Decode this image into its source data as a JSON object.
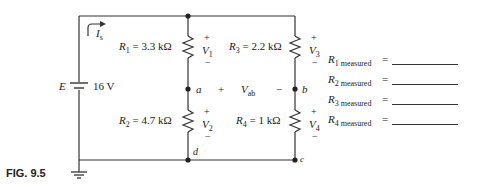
{
  "figure": {
    "label": "FIG. 9.5"
  },
  "circuit": {
    "source": {
      "name": "E",
      "value": "16 V"
    },
    "current": {
      "symbol": "I",
      "subscript": "s"
    },
    "resistors": [
      {
        "name": "R",
        "sub": "1",
        "value": "= 3.3 kΩ",
        "voltage": "V",
        "vsub": "1"
      },
      {
        "name": "R",
        "sub": "2",
        "value": "= 4.7 kΩ",
        "voltage": "V",
        "vsub": "2"
      },
      {
        "name": "R",
        "sub": "3",
        "value": "= 2.2 kΩ",
        "voltage": "V",
        "vsub": "3"
      },
      {
        "name": "R",
        "sub": "4",
        "value": "= 1 kΩ",
        "voltage": "V",
        "vsub": "4"
      }
    ],
    "nodes": {
      "a": "a",
      "b": "b",
      "c": "c",
      "d": "d"
    },
    "vab": {
      "symbol": "V",
      "subscript": "ab",
      "plus": "+",
      "minus": "−"
    },
    "polarity": {
      "plus": "+",
      "minus": "−"
    }
  },
  "measurements": [
    {
      "name": "R",
      "sub": "1 measured",
      "eq": "=",
      "value": ""
    },
    {
      "name": "R",
      "sub": "2 measured",
      "eq": "=",
      "value": ""
    },
    {
      "name": "R",
      "sub": "3 measured",
      "eq": "=",
      "value": ""
    },
    {
      "name": "R",
      "sub": "4 measured",
      "eq": "=",
      "value": ""
    }
  ]
}
